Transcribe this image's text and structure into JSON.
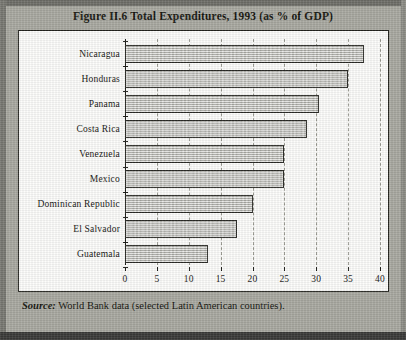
{
  "figure": {
    "title": "Figure II.6  Total Expenditures, 1993  (as %  of GDP)",
    "source_label": "Source:",
    "source_text": " World Bank data (selected Latin American countries)."
  },
  "colors": {
    "page_background": "#a9a9a1",
    "plot_background": "#fdfdfb",
    "bar_fill": "#c7c7c2",
    "bar_border": "#2a2a26",
    "gridline": "#9a9a92",
    "axis": "#1c1c18",
    "text": "#15150f"
  },
  "chart_data": {
    "type": "bar",
    "orientation": "horizontal",
    "title": "Figure II.6  Total Expenditures, 1993  (as %  of GDP)",
    "xlabel": "",
    "ylabel": "",
    "categories": [
      "Nicaragua",
      "Honduras",
      "Panama",
      "Costa Rica",
      "Venezuela",
      "Mexico",
      "Dominican Republic",
      "El Salvador",
      "Guatemala"
    ],
    "values": [
      37.5,
      35.0,
      30.5,
      28.5,
      25.0,
      25.0,
      20.0,
      17.5,
      13.0
    ],
    "xlim": [
      0,
      40
    ],
    "xticks": [
      0,
      5,
      10,
      15,
      20,
      25,
      30,
      35,
      40
    ],
    "xtick_labels": [
      "0",
      "5",
      "10",
      "15",
      "20",
      "25",
      "30",
      "35",
      "40"
    ],
    "grid": "vertical-dashed",
    "legend": "none",
    "unit": "% of GDP"
  }
}
